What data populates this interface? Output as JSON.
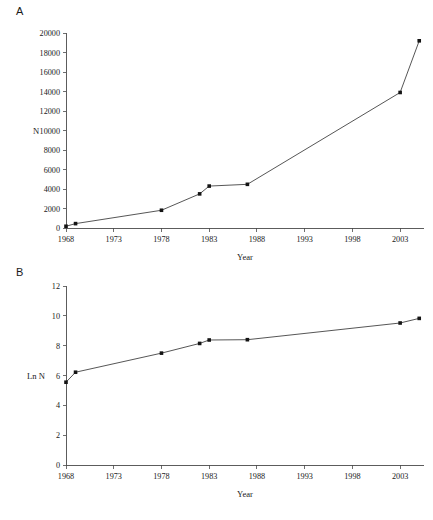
{
  "figure": {
    "background": "#ffffff",
    "line_color": "#2b2b2b",
    "marker_color": "#141414",
    "axis_color": "#4a4a4a",
    "caption": ""
  },
  "panels": [
    {
      "id": "A",
      "label": "A"
    },
    {
      "id": "B",
      "label": "B"
    }
  ],
  "chart_data": [
    {
      "type": "line",
      "panel": "A",
      "title": "A",
      "xlabel": "Year",
      "ylabel": "N",
      "xlim": [
        1968,
        2005.5
      ],
      "ylim": [
        0,
        20000
      ],
      "xticks": [
        1968,
        1973,
        1978,
        1983,
        1988,
        1993,
        1998,
        2003
      ],
      "xtick_labels": [
        "1968",
        "1973",
        "1978",
        "1983",
        "1988",
        "1993",
        "1998",
        "2003"
      ],
      "yticks": [
        0,
        2000,
        4000,
        6000,
        8000,
        10000,
        12000,
        14000,
        16000,
        18000,
        20000
      ],
      "ytick_labels": [
        "0",
        "2000",
        "4000",
        "6000",
        "8000",
        "10000",
        "12000",
        "14000",
        "16000",
        "18000",
        "20000"
      ],
      "grid": false,
      "legend": "none",
      "markers": true,
      "x": [
        1968,
        1969,
        1978,
        1982,
        1983,
        1987,
        2003,
        2005
      ],
      "values": [
        180,
        450,
        1820,
        3500,
        4300,
        4480,
        13900,
        19200
      ]
    },
    {
      "type": "line",
      "panel": "B",
      "title": "B",
      "xlabel": "Year",
      "ylabel": "Ln N",
      "xlim": [
        1968,
        2005.5
      ],
      "ylim": [
        0,
        12
      ],
      "xticks": [
        1968,
        1973,
        1978,
        1983,
        1988,
        1993,
        1998,
        2003
      ],
      "xtick_labels": [
        "1968",
        "1973",
        "1978",
        "1983",
        "1988",
        "1993",
        "1998",
        "2003"
      ],
      "yticks": [
        0,
        2,
        4,
        6,
        8,
        10,
        12
      ],
      "ytick_labels": [
        "0",
        "2",
        "4",
        "6",
        "8",
        "10",
        "12"
      ],
      "grid": false,
      "legend": "none",
      "markers": true,
      "x": [
        1968,
        1969,
        1978,
        1982,
        1983,
        1987,
        2003,
        2005
      ],
      "values": [
        5.55,
        6.22,
        7.5,
        8.15,
        8.38,
        8.4,
        9.52,
        9.83
      ]
    }
  ]
}
